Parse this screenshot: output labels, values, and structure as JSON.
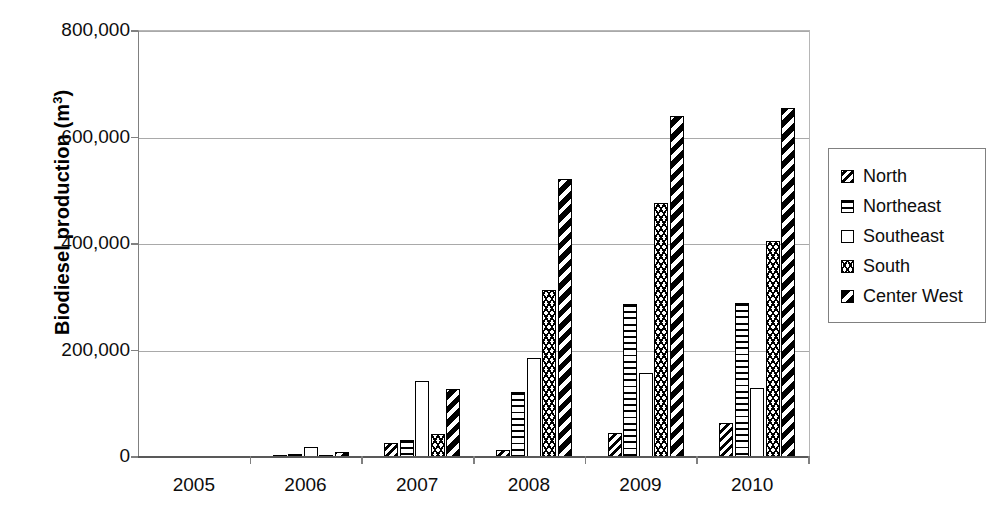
{
  "chart_data": {
    "type": "bar",
    "title": "",
    "xlabel": "",
    "ylabel": "Biodiesel production (m",
    "ylabel_sup": "3",
    "ylabel_suffix": ")",
    "categories": [
      "2005",
      "2006",
      "2007",
      "2008",
      "2009",
      "2010"
    ],
    "series": [
      {
        "name": "North",
        "pattern": "diagonal-hatch",
        "values": [
          0,
          2000,
          27000,
          14000,
          45000,
          64000
        ]
      },
      {
        "name": "Northeast",
        "pattern": "horizontal-lines",
        "values": [
          0,
          6000,
          31000,
          123000,
          287000,
          290000
        ]
      },
      {
        "name": "Southeast",
        "pattern": "solid-white",
        "values": [
          0,
          19000,
          142000,
          185000,
          157000,
          129000
        ]
      },
      {
        "name": "South",
        "pattern": "zigzag-chevron",
        "values": [
          0,
          2000,
          43000,
          313000,
          477000,
          405000
        ]
      },
      {
        "name": "Center West",
        "pattern": "bold-diagonal-stripe",
        "values": [
          0,
          9000,
          128000,
          522000,
          640000,
          656000
        ]
      }
    ],
    "ylim": [
      0,
      800000
    ],
    "yticks": [
      0,
      200000,
      400000,
      600000,
      800000
    ],
    "ytick_labels": [
      "0",
      "200,000",
      "400,000",
      "600,000",
      "800,000"
    ],
    "grid": true,
    "legend_position": "right"
  },
  "legend": {
    "items": [
      {
        "label": "North"
      },
      {
        "label": "Northeast"
      },
      {
        "label": "Southeast"
      },
      {
        "label": "South"
      },
      {
        "label": "Center West"
      }
    ]
  }
}
